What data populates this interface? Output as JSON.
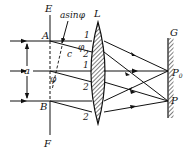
{
  "diagram": {
    "type": "single-slit-fraunhofer-diffraction",
    "labels": {
      "E": "E",
      "F": "F",
      "A": "A",
      "B": "B",
      "a": "a",
      "c": "c",
      "L": "L",
      "G": "G",
      "P0": "P",
      "P0_sub": "0",
      "P": "P",
      "path_diff": "asinφ",
      "phi": "φ",
      "ray1_top": "1",
      "ray2_top": "2",
      "ray1_mid": "1",
      "ray2_mid": "2",
      "ray2_bot": "2"
    },
    "colors": {
      "line": "#111111",
      "background": "#ffffff"
    }
  }
}
